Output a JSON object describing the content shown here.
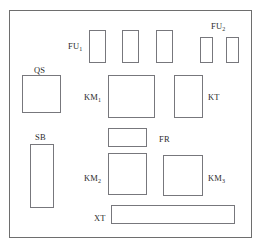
{
  "diagram": {
    "type": "electrical-panel-layout",
    "frame": {
      "x": 9,
      "y": 10,
      "width": 243,
      "height": 228
    },
    "components": [
      {
        "id": "fu1-fuse-1",
        "designation": "FU1",
        "label": "FU",
        "subscript": "1",
        "show_label": true,
        "label_x": 68,
        "label_y": 42,
        "x": 89,
        "y": 30,
        "width": 17,
        "height": 33
      },
      {
        "id": "fu1-fuse-2",
        "designation": "FU1",
        "label": "",
        "subscript": "",
        "show_label": false,
        "label_x": 0,
        "label_y": 0,
        "x": 122,
        "y": 30,
        "width": 17,
        "height": 33
      },
      {
        "id": "fu1-fuse-3",
        "designation": "FU1",
        "label": "",
        "subscript": "",
        "show_label": false,
        "label_x": 0,
        "label_y": 0,
        "x": 156,
        "y": 30,
        "width": 17,
        "height": 33
      },
      {
        "id": "fu2-fuse-1",
        "designation": "FU2",
        "label": "FU",
        "subscript": "2",
        "show_label": true,
        "label_x": 211,
        "label_y": 22,
        "x": 200,
        "y": 37,
        "width": 13,
        "height": 26
      },
      {
        "id": "fu2-fuse-2",
        "designation": "FU2",
        "label": "",
        "subscript": "",
        "show_label": false,
        "label_x": 0,
        "label_y": 0,
        "x": 226,
        "y": 37,
        "width": 13,
        "height": 26
      },
      {
        "id": "qs-disconnect-switch",
        "designation": "QS",
        "label": "QS",
        "subscript": "",
        "show_label": true,
        "label_x": 34,
        "label_y": 66,
        "x": 22,
        "y": 75,
        "width": 39,
        "height": 38
      },
      {
        "id": "km1-contactor",
        "designation": "KM1",
        "label": "KM",
        "subscript": "1",
        "show_label": true,
        "label_x": 84,
        "label_y": 93,
        "x": 108,
        "y": 75,
        "width": 47,
        "height": 43
      },
      {
        "id": "kt-timer-relay",
        "designation": "KT",
        "label": "KT",
        "subscript": "",
        "show_label": true,
        "label_x": 208,
        "label_y": 93,
        "x": 174,
        "y": 75,
        "width": 29,
        "height": 43
      },
      {
        "id": "sb-pushbutton-station",
        "designation": "SB",
        "label": "SB",
        "subscript": "",
        "show_label": true,
        "label_x": 35,
        "label_y": 133,
        "x": 30,
        "y": 144,
        "width": 24,
        "height": 64
      },
      {
        "id": "fr-thermal-overload-relay",
        "designation": "FR",
        "label": "FR",
        "subscript": "",
        "show_label": true,
        "label_x": 159,
        "label_y": 135,
        "x": 108,
        "y": 128,
        "width": 39,
        "height": 19
      },
      {
        "id": "km2-contactor",
        "designation": "KM2",
        "label": "KM",
        "subscript": "2",
        "show_label": true,
        "label_x": 84,
        "label_y": 174,
        "x": 108,
        "y": 153,
        "width": 39,
        "height": 42
      },
      {
        "id": "km3-contactor",
        "designation": "KM3",
        "label": "KM",
        "subscript": "3",
        "show_label": true,
        "label_x": 208,
        "label_y": 174,
        "x": 163,
        "y": 155,
        "width": 40,
        "height": 41
      },
      {
        "id": "xt-terminal-block",
        "designation": "XT",
        "label": "XT",
        "subscript": "",
        "show_label": true,
        "label_x": 94,
        "label_y": 214,
        "x": 111,
        "y": 205,
        "width": 124,
        "height": 19
      }
    ]
  },
  "style": {
    "line_color": "#77777c",
    "frame_color": "#6e6e6e",
    "text_color": "#2b2b2b",
    "background": "#ffffff"
  }
}
